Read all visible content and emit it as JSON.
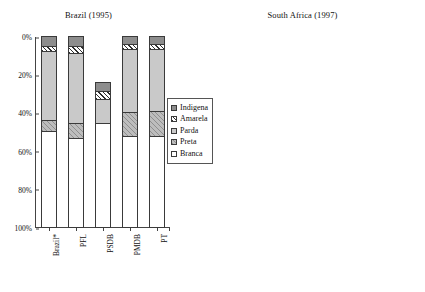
{
  "chart_data": [
    {
      "type": "bar",
      "id": "brazil",
      "title": "Brazil (1995)",
      "xlabel": "",
      "ylabel": "",
      "ylim": [
        0,
        100
      ],
      "stacked": true,
      "percent": true,
      "grid": false,
      "legend_position": "right",
      "yticks": [
        "0%",
        "20%",
        "40%",
        "60%",
        "80%",
        "100%"
      ],
      "ytick_values": [
        0,
        20,
        40,
        60,
        80,
        100
      ],
      "categories": [
        "Brazil*",
        "PFL",
        "PSDB",
        "PMDB",
        "PT"
      ],
      "series": [
        {
          "name": "Branca",
          "fill": "f-white",
          "values": [
            50.5,
            46.5,
            54.5,
            47.5,
            47.5
          ]
        },
        {
          "name": "Preta",
          "fill": "f-diag-light",
          "values": [
            5.5,
            8.0,
            0.0,
            12.5,
            13.5
          ]
        },
        {
          "name": "Parda",
          "fill": "f-vdots",
          "values": [
            36.0,
            36.5,
            12.5,
            33.0,
            32.0
          ]
        },
        {
          "name": "Amarela",
          "fill": "f-hatch",
          "values": [
            3.0,
            4.0,
            4.0,
            3.0,
            3.0
          ]
        },
        {
          "name": "Indigena",
          "fill": "f-solidgray",
          "values": [
            5.0,
            5.0,
            5.0,
            4.0,
            4.0
          ]
        }
      ],
      "legend": [
        "Indigena",
        "Amarela",
        "Parda",
        "Preta",
        "Branca"
      ]
    },
    {
      "type": "bar",
      "id": "south-africa",
      "title": "South Africa (1997)",
      "xlabel": "",
      "ylabel": "",
      "ylim": [
        0,
        100
      ],
      "stacked": true,
      "percent": true,
      "grid": false,
      "legend_position": "right",
      "yticks": [
        "0%",
        "20%",
        "40%",
        "60%",
        "80%",
        "100%"
      ],
      "ytick_values": [
        0,
        20,
        40,
        60,
        80,
        100
      ],
      "categories": [
        "S.Africa*",
        "ANC",
        "IFP",
        "NP",
        "DP"
      ],
      "series": [
        {
          "name": "Black",
          "fill": "f-hlines",
          "values": [
            75.0,
            95.0,
            91.0,
            12.0,
            28.0
          ]
        },
        {
          "name": "Coloured",
          "fill": "f-dkgray",
          "values": [
            8.0,
            5.0,
            0.0,
            38.0,
            6.0
          ]
        },
        {
          "name": "White",
          "fill": "f-white",
          "values": [
            15.0,
            0.0,
            9.0,
            42.0,
            64.0
          ]
        },
        {
          "name": "Asian",
          "fill": "f-vlines",
          "values": [
            2.0,
            0.0,
            0.0,
            8.0,
            2.0
          ]
        }
      ],
      "legend": [
        "Asian",
        "White",
        "Coloured",
        "Black"
      ]
    }
  ],
  "brazil": {
    "title": "Brazil (1995)",
    "yticks": [
      "100%",
      "80%",
      "60%",
      "40%",
      "20%",
      "0%"
    ],
    "xlabels": [
      "Brazil*",
      "PFL",
      "PSDB",
      "PMDB",
      "PT"
    ],
    "legend": [
      {
        "label": "Indigena"
      },
      {
        "label": "Amarela"
      },
      {
        "label": "Parda"
      },
      {
        "label": "Preta"
      },
      {
        "label": "Branca"
      }
    ]
  },
  "south_africa": {
    "title": "South Africa (1997)",
    "yticks": [
      "100%",
      "80%",
      "60%",
      "40%",
      "20%",
      "0%"
    ],
    "xlabels": [
      "S.Africa*",
      "ANC",
      "IFP",
      "NP",
      "DP"
    ],
    "legend": [
      {
        "label": "Asian"
      },
      {
        "label": "White"
      },
      {
        "label": "Coloured"
      },
      {
        "label": "Black"
      }
    ]
  }
}
